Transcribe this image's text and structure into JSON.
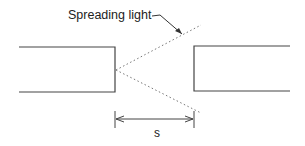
{
  "diagram": {
    "label": "Spreading light",
    "dimension_label": "s",
    "colors": {
      "line": "#444444",
      "dotted": "#777777",
      "text": "#222222"
    }
  }
}
